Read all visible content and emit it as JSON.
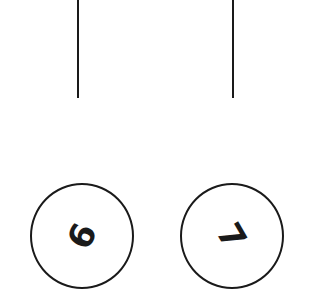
{
  "diagram": {
    "nodes": [
      {
        "label": "6",
        "rotation_deg": -65
      },
      {
        "label": "7",
        "rotation_deg": 60
      }
    ],
    "edges": [
      {
        "to": 0,
        "from": "top"
      },
      {
        "to": 1,
        "from": "top"
      }
    ],
    "stroke_color": "#1a1a1a",
    "background": "#ffffff"
  }
}
